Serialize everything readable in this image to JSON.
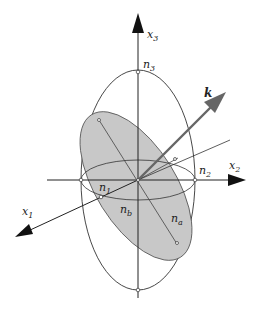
{
  "diagram": {
    "labels": {
      "x3": {
        "base": "x",
        "sub": "3"
      },
      "x2": {
        "base": "x",
        "sub": "2"
      },
      "x1": {
        "base": "x",
        "sub": "1"
      },
      "n3": {
        "base": "n",
        "sub": "3"
      },
      "n2": {
        "base": "n",
        "sub": "2"
      },
      "n1": {
        "base": "n",
        "sub": "1"
      },
      "na": {
        "base": "n",
        "sub": "a"
      },
      "nb": {
        "base": "n",
        "sub": "b"
      },
      "k": "k"
    },
    "colors": {
      "axis": "#222222",
      "ellipse_stroke": "#333333",
      "section_fill": "#c8c8c8",
      "k_arrow": "#666666"
    }
  }
}
